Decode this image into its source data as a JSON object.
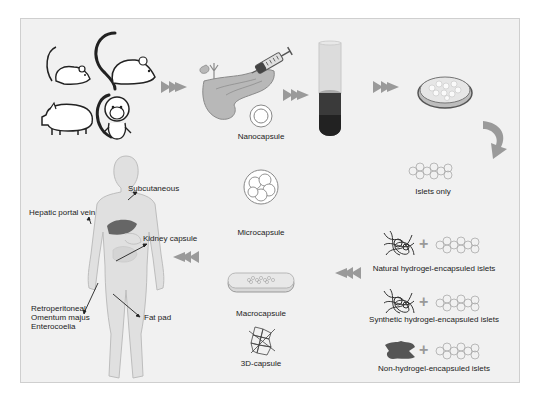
{
  "figure": {
    "colors": {
      "background": "#f1f1f1",
      "frame_border": "#cfcfcf",
      "arrow": "#9a9a9a",
      "organ_fill": "#b8b8b8",
      "liver": "#666666",
      "text": "#222222"
    },
    "source_animals": [
      "mouse",
      "rat",
      "pig",
      "monkey"
    ],
    "process_steps": [
      "donor animals",
      "pancreas digestion",
      "density gradient separation",
      "islet culture dish"
    ],
    "encapsulation_types": [
      {
        "label": "Islets only"
      },
      {
        "label": "Natural hydrogel-encapsuled islets"
      },
      {
        "label": "Synthetic hydrogel-encapsuled islets"
      },
      {
        "label": "Non-hydrogel-encapsuled islets"
      }
    ],
    "capsule_types": [
      {
        "label": "Nanocapsule"
      },
      {
        "label": "Microcapsule"
      },
      {
        "label": "Macrocapsule"
      },
      {
        "label": "3D-capsule"
      }
    ],
    "transplant_sites": {
      "subcutaneous": "Subcutaneous",
      "hepatic": "Hepatic portal vein",
      "kidney": "Kidney capsule",
      "peritoneal": [
        "Retroperitoneal",
        "Omentum majus",
        "Enterocoelia"
      ],
      "fat_pad": "Fat pad"
    },
    "plus_symbol": "+"
  }
}
